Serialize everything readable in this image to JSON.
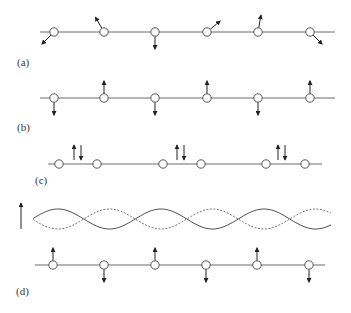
{
  "figure": {
    "colors": {
      "line": "#6a6a6a",
      "arrow": "#222222",
      "atom_fill": "#ffffff",
      "atom_stroke": "#555555"
    },
    "panels": [
      {
        "id": "a",
        "label": "(a)",
        "label_pos": [
          17,
          66
        ],
        "chain_y": 32,
        "chain_x": [
          40,
          335
        ],
        "atoms": [
          {
            "x": 54,
            "spin_angle_deg": 225
          },
          {
            "x": 104,
            "spin_angle_deg": 120
          },
          {
            "x": 155,
            "spin_angle_deg": 270
          },
          {
            "x": 207,
            "spin_angle_deg": 40
          },
          {
            "x": 258,
            "spin_angle_deg": 80
          },
          {
            "x": 310,
            "spin_angle_deg": 315
          }
        ],
        "description": "Spins canted in varying directions (helical / spiral order)"
      },
      {
        "id": "b",
        "label": "(b)",
        "label_pos": [
          17,
          131
        ],
        "chain_y": 98,
        "chain_x": [
          40,
          335
        ],
        "atoms": [
          {
            "x": 54,
            "spin": "down"
          },
          {
            "x": 104,
            "spin": "up"
          },
          {
            "x": 155,
            "spin": "down"
          },
          {
            "x": 207,
            "spin": "up"
          },
          {
            "x": 258,
            "spin": "down"
          },
          {
            "x": 310,
            "spin": "up"
          }
        ],
        "description": "Antiferromagnetic alternating up/down spins on atoms"
      },
      {
        "id": "c",
        "label": "(c)",
        "label_pos": [
          35,
          184
        ],
        "chain_y": 164,
        "chain_x": [
          48,
          322
        ],
        "atoms": [
          {
            "x": 59
          },
          {
            "x": 97
          },
          {
            "x": 163
          },
          {
            "x": 201
          },
          {
            "x": 266
          },
          {
            "x": 305
          }
        ],
        "bond_spin_pairs": [
          {
            "x_up": 74,
            "x_down": 81
          },
          {
            "x_up": 177,
            "x_down": 184
          },
          {
            "x_up": 278,
            "x_down": 285
          }
        ],
        "description": "Dimerized chain with spin-singlet pairs (up/down) on bonds"
      },
      {
        "id": "d",
        "label": "(d)",
        "label_pos": [
          16,
          295
        ],
        "chain_y": 265,
        "chain_x": [
          35,
          325
        ],
        "atoms": [
          {
            "x": 53,
            "spin": "up"
          },
          {
            "x": 104,
            "spin": "down"
          },
          {
            "x": 155,
            "spin": "up"
          },
          {
            "x": 206,
            "spin": "down"
          },
          {
            "x": 257,
            "spin": "up"
          },
          {
            "x": 309,
            "spin": "down"
          }
        ],
        "spin_density_wave": {
          "x_range": [
            33,
            331
          ],
          "center_y": 219,
          "amplitude": 10,
          "period": 103,
          "phase_peak_x": 58,
          "series": [
            {
              "name": "solid",
              "style": "solid"
            },
            {
              "name": "dashed",
              "style": "dashed"
            }
          ],
          "axis_arrow": {
            "x": 21,
            "y_from": 229,
            "y_to": 203
          }
        },
        "description": "Spin density wave with modulated up/down moments on atoms"
      }
    ]
  }
}
